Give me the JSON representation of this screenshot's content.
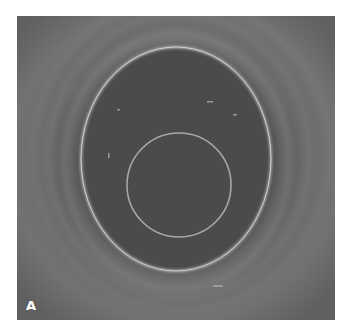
{
  "figure": {
    "panel_label": "A",
    "colors": {
      "background": "#5a5a5a",
      "lumen": "#4a4a4a",
      "ring": "#c8c8c8",
      "label": "#ffffff"
    }
  }
}
